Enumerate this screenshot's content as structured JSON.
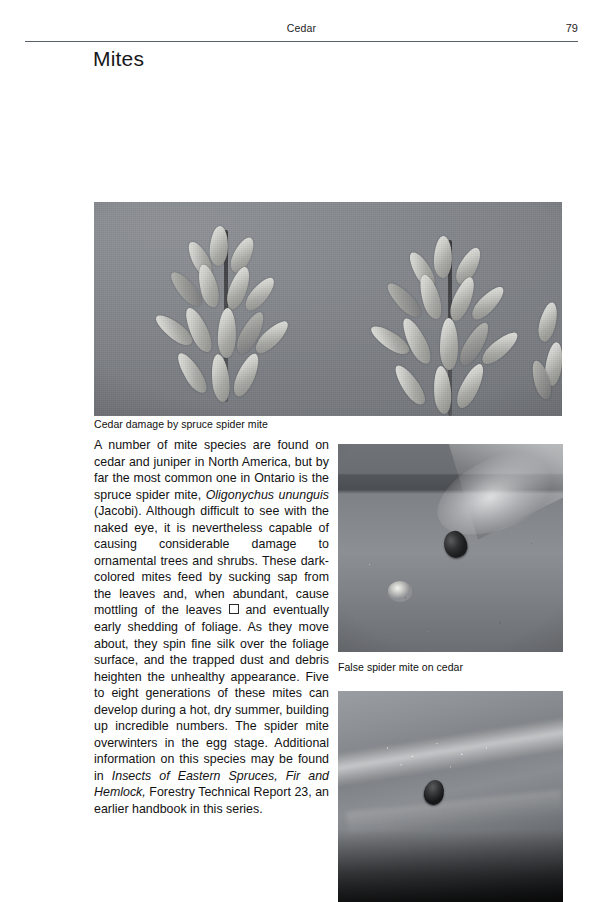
{
  "page": {
    "running_head": "Cedar",
    "page_number": "79",
    "section_title": "Mites"
  },
  "figures": [
    {
      "name": "cedar-damage-photo",
      "caption": "Cedar damage by spruce spider mite",
      "alt": "Grayscale photo of two cedar foliage sprigs showing damage"
    },
    {
      "name": "false-spider-mite-photo",
      "caption": "False spider mite on cedar",
      "alt": "Close-up grayscale photo of a false spider mite on a cedar leaf"
    },
    {
      "name": "mite-closeup-photo",
      "caption": "",
      "alt": "Close-up grayscale photo of a mite on foliage with silk webbing"
    }
  ],
  "body": {
    "paragraph_runs": [
      {
        "text": "A number of mite species are found on cedar and juniper in North America, but by far the most common one in Ontario is the spruce spider mite, ",
        "style": "normal"
      },
      {
        "text": "Oligonychus ununguis",
        "style": "italic"
      },
      {
        "text": " (Jacobi). Although difficult to see with the naked eye, it is nevertheless capable of causing considerable damage to ornamental trees and shrubs. These dark-colored mites feed by sucking sap from the leaves and, when abundant, cause mottling of the leaves ",
        "style": "normal"
      },
      {
        "text": "□",
        "style": "missing-glyph"
      },
      {
        "text": " and eventually early shedding of foliage. As they move about, they spin fine silk over the foliage surface, and the trapped dust and debris heighten the unhealthy appearance. Five to eight generations of these mites can develop during a hot, dry summer, building up incredible numbers. The spider mite overwinters in the egg stage. Additional information on this species may be found in ",
        "style": "normal"
      },
      {
        "text": "Insects of Eastern Spruces, Fir and Hemlock,",
        "style": "italic"
      },
      {
        "text": " Forestry Technical Report 23, an earlier handbook in this series.",
        "style": "normal"
      }
    ]
  }
}
